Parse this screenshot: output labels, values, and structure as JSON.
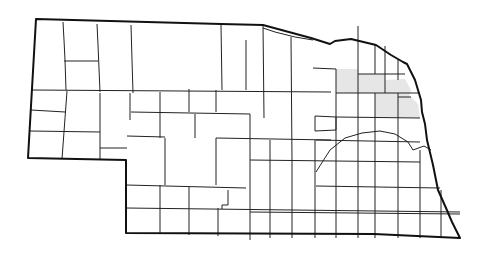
{
  "map": {
    "subject": "Nebraska county outline map",
    "highlight_color": "#e6e6e6",
    "stroke_color": "#111111",
    "highlighted_counties": [
      "Pierce",
      "Wayne",
      "Dixon",
      "Cuming",
      "Burt"
    ]
  }
}
